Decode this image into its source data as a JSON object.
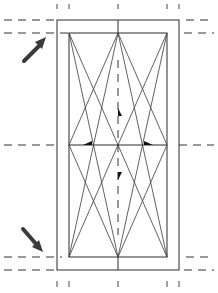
{
  "diagram": {
    "type": "window-opening-symbol",
    "colors": {
      "line": "#2a2a2a",
      "arrow": "#3a3a3a",
      "background": "#ffffff"
    },
    "arrows": [
      {
        "name": "upper-left-arrow",
        "direction": "up-right"
      },
      {
        "name": "lower-left-arrow",
        "direction": "down-right"
      }
    ],
    "opening_markers": [
      "up",
      "down",
      "left",
      "right"
    ]
  }
}
